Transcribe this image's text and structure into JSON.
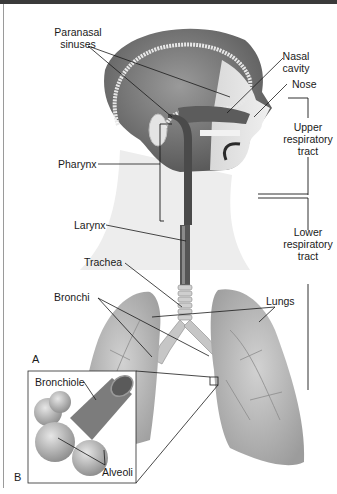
{
  "figure": {
    "panels": [
      {
        "id": "A",
        "label": "A"
      },
      {
        "id": "B",
        "label": "B"
      }
    ],
    "labels": {
      "paranasal_sinuses": [
        "Paranasal",
        "sinuses"
      ],
      "nasal_cavity": [
        "Nasal",
        "cavity"
      ],
      "nose": "Nose",
      "pharynx": "Pharynx",
      "larynx": "Larynx",
      "trachea": "Trachea",
      "bronchi": "Bronchi",
      "lungs": "Lungs",
      "bronchiole": "Bronchiole",
      "alveoli": "Alveoli"
    },
    "brackets": {
      "upper_tract": [
        "Upper",
        "respiratory",
        "tract"
      ],
      "lower_tract": [
        "Lower",
        "respiratory",
        "tract"
      ]
    },
    "colors": {
      "topbar": "#3a3a3a",
      "tissue_dark": "#4a4a4a",
      "tissue_mid": "#8a8a8a",
      "tissue_light": "#c8c8c8",
      "lung": "#b8b8b8",
      "leader_line": "#1a1a1a"
    }
  }
}
